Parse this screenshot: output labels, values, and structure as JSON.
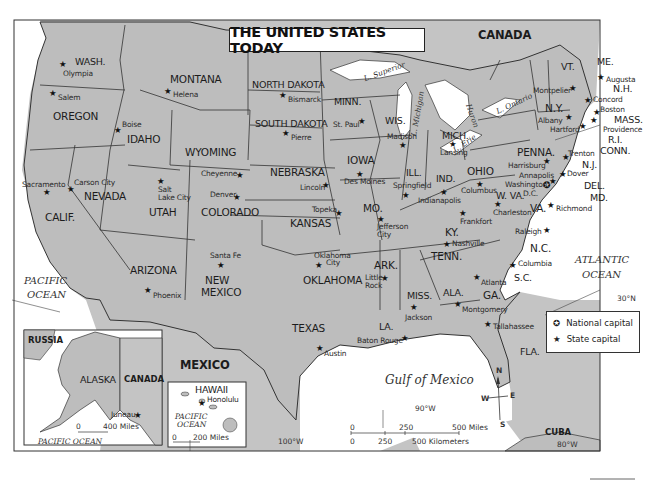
{
  "title": "THE UNITED STATES TODAY",
  "colors": {
    "land": "#bdbdbd",
    "land_other": "#c7c7c7",
    "water": "#ffffff",
    "border": "#333333"
  },
  "countries": {
    "canada": "CANADA",
    "mexico": "MEXICO",
    "cuba": "CUBA",
    "russia": "RUSSIA",
    "canada_inset": "CANADA"
  },
  "water_bodies": {
    "pacific": [
      "PACIFIC",
      "OCEAN"
    ],
    "atlantic": [
      "ATLANTIC",
      "OCEAN"
    ],
    "gulf": "Gulf of Mexico",
    "pacific_alaska": "PACIFIC OCEAN",
    "pacific_hawaii": [
      "PACIFIC",
      "OCEAN"
    ],
    "lake_superior": "L. Superior",
    "lake_michigan": "L. Michigan",
    "lake_huron": "Huron",
    "lake_erie": "L. Erie",
    "lake_ontario": "L. Ontario"
  },
  "states": [
    {
      "name": "WASH.",
      "capital": "Olympia"
    },
    {
      "name": "OREGON",
      "capital": "Salem"
    },
    {
      "name": "CALIF.",
      "capital": "Sacramento"
    },
    {
      "name": "IDAHO",
      "capital": "Boise"
    },
    {
      "name": "NEVADA",
      "capital": "Carson City"
    },
    {
      "name": "MONTANA",
      "capital": "Helena"
    },
    {
      "name": "WYOMING",
      "capital": "Cheyenne"
    },
    {
      "name": "UTAH",
      "capital": [
        "Salt",
        "Lake City"
      ]
    },
    {
      "name": "COLORADO",
      "capital": "Denver"
    },
    {
      "name": "ARIZONA",
      "capital": "Phoenix"
    },
    {
      "name": [
        "NEW",
        "MEXICO"
      ],
      "capital": "Santa Fe"
    },
    {
      "name": "NORTH DAKOTA",
      "capital": "Bismarck"
    },
    {
      "name": "SOUTH DAKOTA",
      "capital": "Pierre"
    },
    {
      "name": "NEBRASKA",
      "capital": "Lincoln"
    },
    {
      "name": "KANSAS",
      "capital": "Topeka"
    },
    {
      "name": "OKLAHOMA",
      "capital": [
        "Oklahoma",
        "City"
      ]
    },
    {
      "name": "TEXAS",
      "capital": "Austin"
    },
    {
      "name": "MINN.",
      "capital": "St. Paul"
    },
    {
      "name": "IOWA",
      "capital": "Des Moines"
    },
    {
      "name": "MO.",
      "capital": [
        "Jefferson",
        "City"
      ]
    },
    {
      "name": "ARK.",
      "capital": [
        "Little",
        "Rock"
      ]
    },
    {
      "name": "LA.",
      "capital": "Baton Rouge"
    },
    {
      "name": "WIS.",
      "capital": "Madison"
    },
    {
      "name": "ILL.",
      "capital": "Springfield"
    },
    {
      "name": "MICH.",
      "capital": "Lansing"
    },
    {
      "name": "IND.",
      "capital": "Indianapolis"
    },
    {
      "name": "OHIO",
      "capital": "Columbus"
    },
    {
      "name": "KY.",
      "capital": "Frankfort"
    },
    {
      "name": "TENN.",
      "capital": "Nashville"
    },
    {
      "name": "MISS.",
      "capital": "Jackson"
    },
    {
      "name": "ALA.",
      "capital": "Montgomery"
    },
    {
      "name": "GA.",
      "capital": "Atlanta"
    },
    {
      "name": "FLA.",
      "capital": "Tallahassee"
    },
    {
      "name": "S.C.",
      "capital": "Columbia"
    },
    {
      "name": "N.C.",
      "capital": "Raleigh"
    },
    {
      "name": "VA.",
      "capital": "Richmond"
    },
    {
      "name": "W. VA.",
      "capital": "Charleston"
    },
    {
      "name": "PENNA.",
      "capital": "Harrisburg"
    },
    {
      "name": "N.Y.",
      "capital": "Albany"
    },
    {
      "name": "VT.",
      "capital": "Montpelier"
    },
    {
      "name": "N.H.",
      "capital": "Concord"
    },
    {
      "name": "ME.",
      "capital": "Augusta"
    },
    {
      "name": "MASS.",
      "capital": "Boston"
    },
    {
      "name": "R.I.",
      "capital": "Providence"
    },
    {
      "name": "CONN.",
      "capital": "Hartford"
    },
    {
      "name": "N.J.",
      "capital": "Trenton"
    },
    {
      "name": "DEL.",
      "capital": "Dover"
    },
    {
      "name": "MD.",
      "capital": "Annapolis"
    },
    {
      "name": "ALASKA",
      "capital": "Juneau"
    },
    {
      "name": "HAWAII",
      "capital": "Honolulu"
    }
  ],
  "national_capital": "Washington, D.C.",
  "national_capital_parts": [
    "Washington,",
    "D.C."
  ],
  "legend": {
    "items": [
      {
        "symbol": "✪",
        "label": "National capital"
      },
      {
        "symbol": "★",
        "label": "State capital"
      }
    ]
  },
  "gridlines": {
    "lat_30": "30°N",
    "lon_100": "100°W",
    "lon_90": "90°W",
    "lon_80": "80°W"
  },
  "scale_main": {
    "miles": [
      "0",
      "250",
      "500 Miles"
    ],
    "km": [
      "0",
      "250",
      "500 Kilometers"
    ]
  },
  "scale_alaska": [
    "0",
    "400 Miles"
  ],
  "scale_hawaii": [
    "0",
    "200 Miles"
  ],
  "compass": {
    "n": "N",
    "s": "S",
    "e": "E",
    "w": "W"
  }
}
